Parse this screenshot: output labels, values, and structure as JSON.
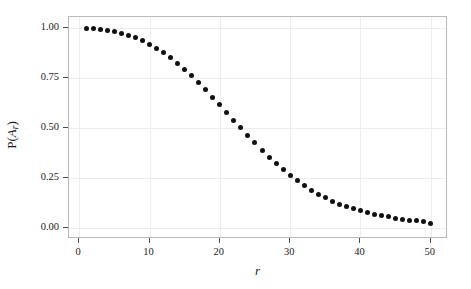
{
  "chart_data": {
    "type": "scatter",
    "title": "",
    "xlabel": "r",
    "ylabel": "P(A_r)",
    "ylabel_parts": {
      "prefix": "P(",
      "italic": "A",
      "subscript": "r",
      "suffix": ")"
    },
    "xlim": [
      -1.45,
      52.45
    ],
    "ylim": [
      -0.055,
      1.055
    ],
    "grid": true,
    "legend": null,
    "marker": {
      "shape": "circle",
      "color": "#101010",
      "size_px": 5
    },
    "xticks": [
      0,
      10,
      20,
      30,
      40,
      50
    ],
    "xtick_labels": [
      "0",
      "10",
      "20",
      "30",
      "40",
      "50"
    ],
    "yticks": [
      0.0,
      0.25,
      0.5,
      0.75,
      1.0
    ],
    "ytick_labels": [
      "0.00",
      "0.25",
      "0.50",
      "0.75",
      "1.00"
    ],
    "x": [
      1,
      2,
      3,
      4,
      5,
      6,
      7,
      8,
      9,
      10,
      11,
      12,
      13,
      14,
      15,
      16,
      17,
      18,
      19,
      20,
      21,
      22,
      23,
      24,
      25,
      26,
      27,
      28,
      29,
      30,
      31,
      32,
      33,
      34,
      35,
      36,
      37,
      38,
      39,
      40,
      41,
      42,
      43,
      44,
      45,
      46,
      47,
      48,
      49,
      50
    ],
    "values": [
      1.0,
      0.998,
      0.995,
      0.99,
      0.983,
      0.975,
      0.965,
      0.952,
      0.937,
      0.919,
      0.899,
      0.876,
      0.851,
      0.823,
      0.793,
      0.761,
      0.727,
      0.692,
      0.655,
      0.617,
      0.579,
      0.54,
      0.501,
      0.463,
      0.426,
      0.39,
      0.355,
      0.322,
      0.291,
      0.262,
      0.236,
      0.211,
      0.189,
      0.169,
      0.151,
      0.135,
      0.12,
      0.108,
      0.096,
      0.086,
      0.077,
      0.069,
      0.062,
      0.056,
      0.05,
      0.045,
      0.04,
      0.036,
      0.031,
      0.025
    ],
    "series_name": "P(A_r)",
    "panel_background": "#ffffff",
    "grid_color": "#ededf0",
    "frame_color": "#b9b9b9",
    "text_color": "#1a1a1a"
  }
}
